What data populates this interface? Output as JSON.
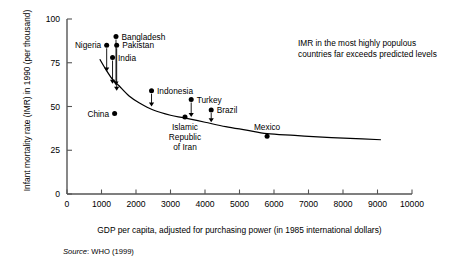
{
  "chart_data": {
    "type": "scatter",
    "title": "",
    "xlabel": "GDP per capita, adjusted for purchasing power (in 1985 international dollars)",
    "ylabel": "Infant mortality rate (IMR) in 1990 (per thousand)",
    "xlim": [
      0,
      10000
    ],
    "ylim": [
      0,
      100
    ],
    "xticks": [
      0,
      1000,
      2000,
      3000,
      4000,
      5000,
      6000,
      7000,
      8000,
      9000,
      10000
    ],
    "xticklabels": [
      "0",
      "1000",
      "2000",
      "3000",
      "4000",
      "5000",
      "6000",
      "7000",
      "8000",
      "9000",
      "10000"
    ],
    "yticks": [
      0,
      25,
      50,
      75,
      100
    ],
    "yticklabels": [
      "0",
      "25",
      "50",
      "75",
      "100"
    ],
    "grid": false,
    "legend": false,
    "annotation": "IMR in the most highly populous countries far exceeds predicted levels",
    "source": "Source: WHO (1999)",
    "source_prefix": "Source",
    "source_rest": ": WHO (1999)",
    "points": [
      {
        "name": "Nigeria",
        "x": 1150,
        "y": 85,
        "label": "Nigeria",
        "label_side": "left",
        "arrow_to": 70
      },
      {
        "name": "Bangladesh",
        "x": 1420,
        "y": 90,
        "label": "Bangladesh",
        "label_side": "right",
        "arrow_to": 62
      },
      {
        "name": "Pakistan",
        "x": 1440,
        "y": 85,
        "label": "Pakistan",
        "label_side": "right",
        "arrow_to": 59
      },
      {
        "name": "India",
        "x": 1320,
        "y": 78,
        "label": "India",
        "label_side": "right",
        "arrow_to": 63
      },
      {
        "name": "Indonesia",
        "x": 2450,
        "y": 59,
        "label": "Indonesia",
        "label_side": "right",
        "arrow_to": 50
      },
      {
        "name": "China",
        "x": 1380,
        "y": 46,
        "label": "China",
        "label_side": "left",
        "arrow_to": null
      },
      {
        "name": "Islamic Republic of Iran",
        "x": 3420,
        "y": 44,
        "label": "Islamic Republic of Iran",
        "label_side": "below",
        "arrow_to": null
      },
      {
        "name": "Turkey",
        "x": 3600,
        "y": 54,
        "label": "Turkey",
        "label_side": "right",
        "arrow_to": 44
      },
      {
        "name": "Brazil",
        "x": 4180,
        "y": 48,
        "label": "Brazil",
        "label_side": "right",
        "arrow_to": 41
      },
      {
        "name": "Mexico",
        "x": 5800,
        "y": 33,
        "label": "Mexico",
        "label_side": "above",
        "arrow_to": null
      }
    ],
    "fit_curve": {
      "name": "predicted IMR",
      "x": [
        950,
        1100,
        1300,
        1500,
        1800,
        2100,
        2500,
        3000,
        3400,
        4000,
        4600,
        5200,
        5800,
        6600,
        7400,
        8200,
        9100
      ],
      "y": [
        77,
        72,
        66,
        62,
        56,
        52,
        48,
        45,
        43.5,
        41,
        38.5,
        36.5,
        34.5,
        33.5,
        32.5,
        31.8,
        31
      ]
    }
  }
}
